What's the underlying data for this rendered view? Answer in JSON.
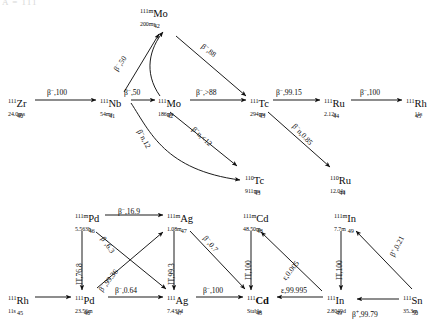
{
  "header": {
    "clipped_text": "A = 111"
  },
  "diagram": {
    "nuclides": [
      {
        "id": "Zr111",
        "mass": "111",
        "z": "40",
        "el": "Zr",
        "halflife": "24.0ms",
        "x": 8,
        "y": 98,
        "stable": false
      },
      {
        "id": "Nb111",
        "mass": "111",
        "z": "41",
        "el": "Nb",
        "halflife": "54ms",
        "x": 100,
        "y": 98,
        "stable": false
      },
      {
        "id": "Mo111m",
        "mass": "111m",
        "z": "42",
        "el": "Mo",
        "halflife": "200ms",
        "x": 140,
        "y": 8,
        "stable": false
      },
      {
        "id": "Mo111",
        "mass": "111",
        "z": "42",
        "el": "Mo",
        "halflife": "186ms",
        "x": 158,
        "y": 98,
        "stable": false
      },
      {
        "id": "Tc111",
        "mass": "111",
        "z": "43",
        "el": "Tc",
        "halflife": "294ms",
        "x": 250,
        "y": 98,
        "stable": false
      },
      {
        "id": "Ru111",
        "mass": "111",
        "z": "44",
        "el": "Ru",
        "halflife": "2.12s",
        "x": 324,
        "y": 98,
        "stable": false
      },
      {
        "id": "Rh111t",
        "mass": "111",
        "z": "45",
        "el": "Rh",
        "halflife": "11s",
        "x": 406,
        "y": 98,
        "stable": false
      },
      {
        "id": "Tc110",
        "mass": "110",
        "z": "43",
        "el": "Tc",
        "halflife": "911ms",
        "x": 245,
        "y": 175,
        "stable": false
      },
      {
        "id": "Ru110",
        "mass": "110",
        "z": "44",
        "el": "Ru",
        "halflife": "12.04s",
        "x": 330,
        "y": 175,
        "stable": false
      },
      {
        "id": "Pd111m",
        "mass": "111m",
        "z": "46",
        "el": "Pd",
        "halflife": "5.563h",
        "x": 75,
        "y": 213,
        "stable": false
      },
      {
        "id": "Ag111m",
        "mass": "111m",
        "z": "47",
        "el": "Ag",
        "halflife": "1.08m",
        "x": 167,
        "y": 213,
        "stable": false
      },
      {
        "id": "Cd111m",
        "mass": "111m",
        "z": "48",
        "el": "Cd",
        "halflife": "48.50m",
        "x": 243,
        "y": 213,
        "stable": false
      },
      {
        "id": "In111m",
        "mass": "111m",
        "z": "49",
        "el": "In",
        "halflife": "7.7m",
        "x": 334,
        "y": 213,
        "stable": false
      },
      {
        "id": "Rh111b",
        "mass": "111",
        "z": "45",
        "el": "Rh",
        "halflife": "11s",
        "x": 8,
        "y": 295,
        "stable": false
      },
      {
        "id": "Pd111",
        "mass": "111",
        "z": "46",
        "el": "Pd",
        "halflife": "23.56m",
        "x": 75,
        "y": 295,
        "stable": false
      },
      {
        "id": "Ag111",
        "mass": "111",
        "z": "47",
        "el": "Ag",
        "halflife": "7.433d",
        "x": 167,
        "y": 295,
        "stable": false
      },
      {
        "id": "Cd111",
        "mass": "111",
        "z": "48",
        "el": "Cd",
        "halflife": "Stable",
        "x": 247,
        "y": 295,
        "stable": true
      },
      {
        "id": "In111",
        "mass": "111",
        "z": "49",
        "el": "In",
        "halflife": "2.8049d",
        "x": 327,
        "y": 295,
        "stable": false
      },
      {
        "id": "Sn111",
        "mass": "111",
        "z": "50",
        "el": "Sn",
        "halflife": "35.3m",
        "x": 403,
        "y": 295,
        "stable": false
      }
    ],
    "transitions": [
      {
        "id": "t01",
        "from": "Zr111",
        "to": "Nb111",
        "mode": "β⁻",
        "branch": "100",
        "label": "β<sup>−</sup>,100",
        "x": 47,
        "y": 88,
        "rot": 0
      },
      {
        "id": "t02",
        "from": "Nb111",
        "to": "Mo111",
        "mode": "β⁻",
        "branch": "50",
        "label": "β<sup>−</sup>,50",
        "x": 124,
        "y": 88,
        "rot": 0
      },
      {
        "id": "t03",
        "from": "Nb111",
        "to": "Mo111m",
        "mode": "β⁻",
        "branch": "50",
        "label": "β<sup>−</sup>,50",
        "x": 112,
        "y": 68,
        "rot": -56
      },
      {
        "id": "t04",
        "from": "Mo111m",
        "to": "Tc111",
        "mode": "β⁻",
        "branch": "88",
        "label": "β<sup>−</sup>,88",
        "x": 205,
        "y": 42,
        "rot": 38
      },
      {
        "id": "t05",
        "from": "Mo111",
        "to": "Tc111",
        "mode": "β⁻",
        "branch": ">88",
        "label": "β<sup>−</sup>,>88",
        "x": 198,
        "y": 88,
        "rot": 0
      },
      {
        "id": "t06",
        "from": "Tc111",
        "to": "Ru111",
        "mode": "β⁻",
        "branch": "99.15",
        "label": "β<sup>−</sup>,99.15",
        "x": 277,
        "y": 88,
        "rot": 0
      },
      {
        "id": "t07",
        "from": "Ru111",
        "to": "Rh111t",
        "mode": "β⁻",
        "branch": "100",
        "label": "β<sup>−</sup>,100",
        "x": 362,
        "y": 88,
        "rot": 0
      },
      {
        "id": "t08",
        "from": "Nb111",
        "to": "Tc110",
        "mode": "β⁻n",
        "branch": "12",
        "label": "β<sup>−</sup>n,12",
        "x": 143,
        "y": 128,
        "rot": 62
      },
      {
        "id": "t09",
        "from": "Mo111",
        "to": "Tc110",
        "mode": "β⁻n",
        "branch": "<12",
        "label": "β<sup>−</sup>n,<12",
        "x": 196,
        "y": 125,
        "rot": 43
      },
      {
        "id": "t10",
        "from": "Tc111",
        "to": "Ru110",
        "mode": "β⁻n",
        "branch": "0.85",
        "label": "β<sup>−</sup>n,0.85",
        "x": 297,
        "y": 122,
        "rot": 47
      },
      {
        "id": "t11",
        "from": "Pd111m",
        "to": "Ag111m",
        "mode": "β⁻",
        "branch": "16.9",
        "label": "β<sup>−</sup>,16.9",
        "x": 120,
        "y": 207,
        "rot": 0
      },
      {
        "id": "t12",
        "from": "Pd111m",
        "to": "Pd111",
        "mode": "IT",
        "branch": "76.8",
        "label": "IT,76.8",
        "x": 76,
        "y": 285,
        "rot": -90
      },
      {
        "id": "t13",
        "from": "Pd111m",
        "to": "Ag111",
        "mode": "β⁻",
        "branch": "6.3",
        "label": "β<sup>−</sup>,6.3",
        "x": 106,
        "y": 235,
        "rot": 55
      },
      {
        "id": "t14",
        "from": "Pd111",
        "to": "Ag111m",
        "mode": "β⁻",
        "branch": "99.36",
        "label": "β<sup>−</sup>,99.36",
        "x": 97,
        "y": 286,
        "rot": -52
      },
      {
        "id": "t15",
        "from": "Ag111m",
        "to": "Ag111",
        "mode": "IT",
        "branch": "99.3",
        "label": "IT,99.3",
        "x": 168,
        "y": 285,
        "rot": -90
      },
      {
        "id": "t16",
        "from": "Ag111m",
        "to": "Cd111",
        "mode": "β⁻",
        "branch": "0.7",
        "label": "β<sup>−</sup>,0.7",
        "x": 208,
        "y": 234,
        "rot": 50
      },
      {
        "id": "t17",
        "from": "Pd111",
        "to": "Ag111",
        "mode": "β⁻",
        "branch": "0.64",
        "label": "β<sup>−</sup>,0.64",
        "x": 118,
        "y": 286,
        "rot": 0
      },
      {
        "id": "t18",
        "from": "Ag111",
        "to": "Cd111",
        "mode": "β⁻",
        "branch": "100",
        "label": "β<sup>−</sup>,100",
        "x": 205,
        "y": 286,
        "rot": 0
      },
      {
        "id": "t19",
        "from": "Cd111m",
        "to": "Cd111",
        "mode": "IT",
        "branch": "100",
        "label": "IT,100",
        "x": 245,
        "y": 283,
        "rot": -90
      },
      {
        "id": "t20",
        "from": "In111",
        "to": "Cd111m",
        "mode": "ε",
        "branch": "0.005",
        "label": "ε,0.005",
        "x": 281,
        "y": 277,
        "rot": -52
      },
      {
        "id": "t21",
        "from": "In111",
        "to": "Cd111",
        "mode": "ε",
        "branch": "99.995",
        "label": "ε,99.995",
        "x": 283,
        "y": 287,
        "rot": 0
      },
      {
        "id": "t22",
        "from": "In111m",
        "to": "In111",
        "mode": "IT",
        "branch": "100",
        "label": "IT,100",
        "x": 336,
        "y": 283,
        "rot": -90
      },
      {
        "id": "t23",
        "from": "Sn111",
        "to": "In111m",
        "mode": "β⁺",
        "branch": "0.21",
        "label": "β<sup>+</sup>,0.21",
        "x": 388,
        "y": 254,
        "rot": -62
      },
      {
        "id": "t24",
        "from": "Sn111",
        "to": "In111",
        "mode": "β⁺",
        "branch": "99.79",
        "label": "β<sup>+</sup>,99.79",
        "x": 355,
        "y": 310,
        "rot": 0
      }
    ]
  }
}
